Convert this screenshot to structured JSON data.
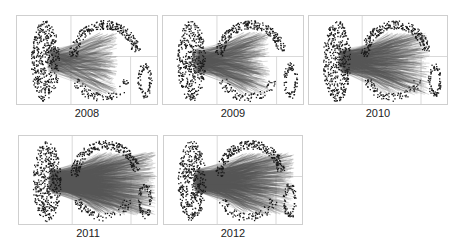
{
  "figure": {
    "panels": [
      {
        "label": "2008",
        "x": 16,
        "y": 15,
        "w": 142,
        "h": 90,
        "edges": 260,
        "spread": 0.35,
        "seed": 11
      },
      {
        "label": "2009",
        "x": 162,
        "y": 15,
        "w": 142,
        "h": 90,
        "edges": 420,
        "spread": 0.45,
        "seed": 23
      },
      {
        "label": "2010",
        "x": 308,
        "y": 15,
        "w": 140,
        "h": 90,
        "edges": 520,
        "spread": 0.7,
        "seed": 37
      },
      {
        "label": "2011",
        "x": 18,
        "y": 135,
        "w": 140,
        "h": 90,
        "edges": 900,
        "spread": 0.95,
        "seed": 41
      },
      {
        "label": "2012",
        "x": 163,
        "y": 135,
        "w": 140,
        "h": 90,
        "edges": 700,
        "spread": 0.85,
        "seed": 53
      }
    ],
    "colors": {
      "node": "#1a1a1a",
      "edge": "#555555",
      "grid": "#cfcfcf"
    }
  }
}
